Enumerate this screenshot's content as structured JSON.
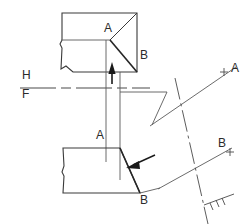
{
  "drawing": {
    "title": "Descriptive geometry projection: auxiliary view of an inclined face",
    "type": "orthographic-projection-construction",
    "colors": {
      "line": "#3a3a3a",
      "line_light": "#6b6b6b",
      "background": "#ffffff",
      "text": "#2b2b2b",
      "arrow_fill": "#1a1a1a"
    },
    "labels": [
      {
        "id": "top-A",
        "text": "A",
        "x": 104,
        "y": 27
      },
      {
        "id": "top-B",
        "text": "B",
        "x": 140,
        "y": 54
      },
      {
        "id": "fold-H",
        "text": "H",
        "x": 22,
        "y": 74
      },
      {
        "id": "fold-F",
        "text": "F",
        "x": 22,
        "y": 91
      },
      {
        "id": "aux-A",
        "text": "A",
        "x": 233,
        "y": 68
      },
      {
        "id": "bottom-A",
        "text": "A",
        "x": 97,
        "y": 125
      },
      {
        "id": "aux-B",
        "text": "B",
        "x": 219,
        "y": 142
      },
      {
        "id": "bottom-B",
        "text": "B",
        "x": 141,
        "y": 196
      }
    ],
    "fold_line": {
      "name": "H/F fold line",
      "upper_label": "H",
      "lower_label": "F",
      "style": "dash-dot",
      "y": 88,
      "x_start": 20,
      "x_end": 150
    },
    "views": {
      "top_view": {
        "name": "top-view-horizontal-projection",
        "outline": "62,13 137,13 137,72 73,72 62,62 62,13",
        "internal_edges": [
          "62,40 110,40",
          "110,40 137,13",
          "110,40 137,72"
        ],
        "vertices": {
          "A": [
            110,
            40
          ],
          "B": [
            137,
            72
          ]
        }
      },
      "front_view": {
        "name": "front-view-frontal-projection",
        "outline": "63,148 120,148 140,193 63,193 63,148",
        "vertices": {
          "A": [
            120,
            148
          ],
          "B": [
            140,
            193
          ]
        }
      }
    },
    "projection_lines": [
      {
        "name": "vertical-projector-A",
        "x": 106,
        "y1": 40,
        "y2": 160
      },
      {
        "name": "vertical-projector-B",
        "x": 120,
        "y1": 72,
        "y2": 178
      }
    ],
    "arrows": [
      {
        "name": "sight-direction-arrow-top",
        "dir": "up",
        "x": 112,
        "y": 66,
        "length": 18
      },
      {
        "name": "sight-direction-arrow-front",
        "dir": "up-left",
        "x": 128,
        "y": 163
      }
    ],
    "auxiliary": {
      "name": "auxiliary-projection-plane",
      "ray_A": "152,125 238,66",
      "ray_B": "160,188 224,147",
      "fold_dashdot": "238,60 200,215",
      "tick_marks": [
        "+ at A",
        "+ at B",
        "hatch at bottom-right"
      ],
      "plus_marks": [
        {
          "id": "plus-A",
          "x": 224,
          "y": 72
        },
        {
          "id": "plus-B",
          "x": 230,
          "y": 152
        }
      ]
    },
    "connector": {
      "name": "top-connector-path",
      "path": "120,92 167,92 152,125"
    }
  }
}
